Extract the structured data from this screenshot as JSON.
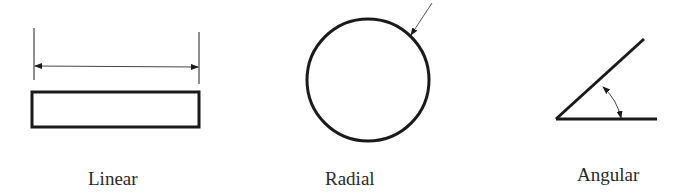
{
  "figures": [
    {
      "id": "linear",
      "label": "Linear",
      "icon": "linear-dimension-icon"
    },
    {
      "id": "radial",
      "label": "Radial",
      "icon": "radial-dimension-icon"
    },
    {
      "id": "angular",
      "label": "Angular",
      "icon": "angular-dimension-icon"
    }
  ],
  "colors": {
    "stroke": "#1a1a1a",
    "dim_line": "#444444",
    "text": "#2a2a2a",
    "background": "#ffffff"
  }
}
